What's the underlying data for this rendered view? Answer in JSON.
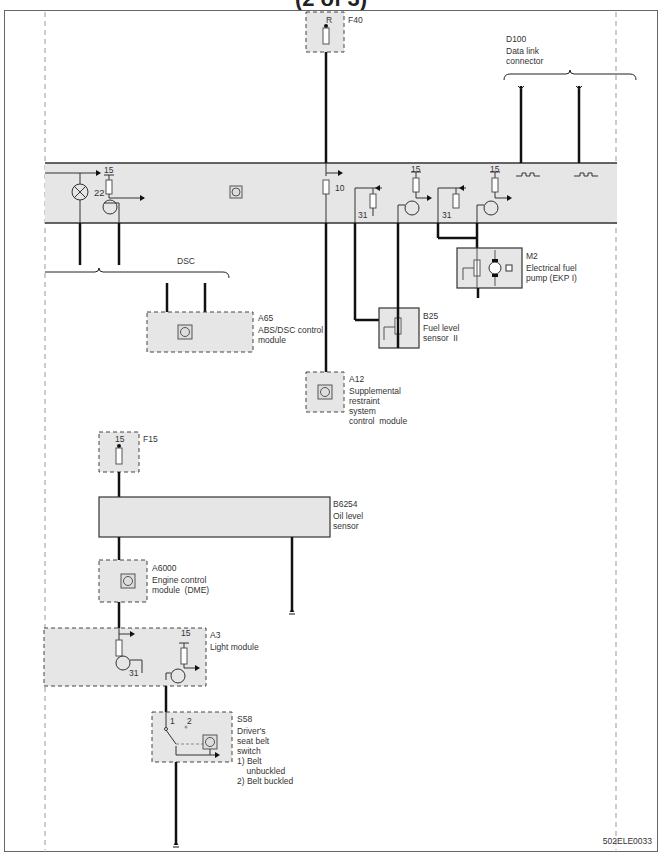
{
  "header": {
    "title": "(2 of 3)"
  },
  "footer": {
    "code": "502ELE0033"
  },
  "components": {
    "f40": {
      "id": "F40",
      "terminal": "R"
    },
    "d100": {
      "id": "D100",
      "name": "Data link\nconnector"
    },
    "bus": {
      "lamp_label": "22",
      "t15_a": "15",
      "t15_b": "15",
      "t15_c": "15",
      "r10": "10",
      "t31_a": "31",
      "t31_b": "31"
    },
    "dsc": {
      "label": "DSC"
    },
    "a65": {
      "id": "A65",
      "name": "ABS/DSC control\nmodule"
    },
    "m2": {
      "id": "M2",
      "name": "Electrical fuel\npump (EKP I)"
    },
    "b25": {
      "id": "B25",
      "name": "Fuel level\nsensor  II"
    },
    "a12": {
      "id": "A12",
      "name": "Supplemental\nrestraint\nsystem\ncontrol  module"
    },
    "f15": {
      "id": "F15",
      "terminal": "15"
    },
    "b6254": {
      "id": "B6254",
      "name": "Oil level\nsensor"
    },
    "a6000": {
      "id": "A6000",
      "name": "Engine control\nmodule  (DME)"
    },
    "a3": {
      "id": "A3",
      "name": "Light module",
      "t15": "15",
      "t31": "31"
    },
    "s58": {
      "id": "S58",
      "name": "Driver's\nseat belt\nswitch",
      "pos1": "1",
      "pos2": "2",
      "note1": "1) Belt\n    unbuckled",
      "note2": "2) Belt buckled"
    }
  }
}
